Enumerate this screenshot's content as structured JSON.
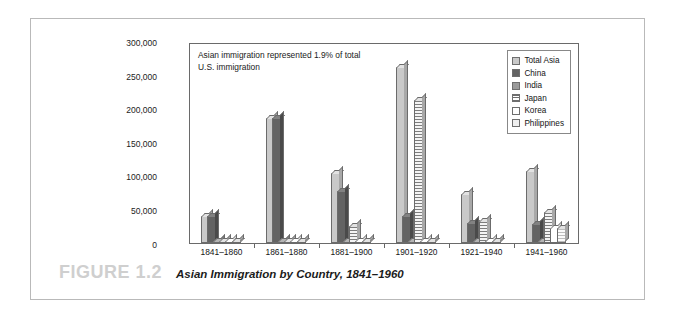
{
  "figure": {
    "number_label": "FIGURE 1.2",
    "title": "Asian Immigration by Country, 1841–1960"
  },
  "annotation": {
    "text": "Asian immigration represented 1.9% of total\nU.S. immigration"
  },
  "legend": {
    "position": "top-right",
    "entries": [
      {
        "label": "Total Asia",
        "color": "#c9c9c9",
        "pattern": "solid"
      },
      {
        "label": "China",
        "color": "#636363",
        "pattern": "solid"
      },
      {
        "label": "India",
        "color": "#9a9a9a",
        "pattern": "solid"
      },
      {
        "label": "Japan",
        "color": "#e8e8e8",
        "pattern": "horizontal-stripes"
      },
      {
        "label": "Korea",
        "color": "#ffffff",
        "pattern": "solid"
      },
      {
        "label": "Philippines",
        "color": "#efefef",
        "pattern": "solid"
      }
    ]
  },
  "axis": {
    "y_ticks": [
      "300,000",
      "250,000",
      "200,000",
      "150,000",
      "100,000",
      "50,000",
      "0"
    ],
    "y_min": 0,
    "y_max": 300000,
    "y_step": 50000,
    "x_label": "",
    "y_label": ""
  },
  "chart_data": {
    "type": "bar",
    "title": "Asian Immigration by Country, 1841–1960",
    "subtitle": "Asian immigration represented 1.9% of total U.S. immigration",
    "xlabel": "",
    "ylabel": "",
    "ylim": [
      0,
      300000
    ],
    "ytick_step": 50000,
    "grid": false,
    "legend_position": "top-right",
    "style": "3d-clustered-column",
    "categories": [
      "1841–1860",
      "1861–1880",
      "1881–1900",
      "1901–1920",
      "1921–1940",
      "1941–1960"
    ],
    "series": [
      {
        "name": "Total Asia",
        "color": "#c9c9c9",
        "values": [
          41000,
          186000,
          105000,
          262000,
          73000,
          108000
        ]
      },
      {
        "name": "China",
        "color": "#636363",
        "values": [
          41000,
          186000,
          78000,
          40000,
          30000,
          28000
        ]
      },
      {
        "name": "India",
        "color": "#9a9a9a",
        "values": [
          500,
          500,
          1500,
          3000,
          2000,
          2500
        ]
      },
      {
        "name": "Japan",
        "color": "#e8e8e8",
        "values": [
          200,
          300,
          26000,
          213000,
          33000,
          47000
        ]
      },
      {
        "name": "Korea",
        "color": "#ffffff",
        "values": [
          0,
          0,
          200,
          1000,
          1500,
          23000
        ]
      },
      {
        "name": "Philippines",
        "color": "#efefef",
        "values": [
          0,
          0,
          300,
          1500,
          2500,
          23000
        ]
      }
    ]
  }
}
